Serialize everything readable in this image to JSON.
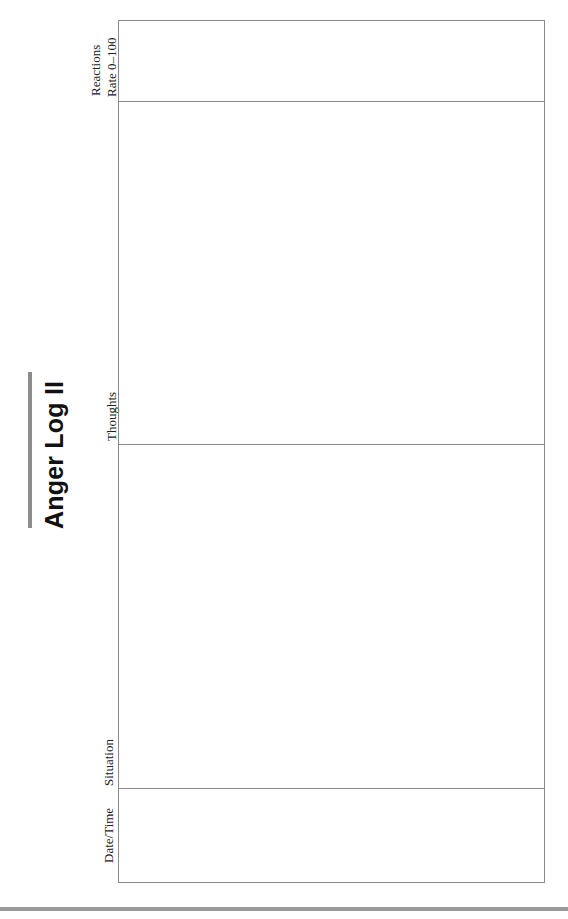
{
  "page": {
    "title": "Anger Log II"
  },
  "table": {
    "columns": [
      {
        "label": "Date/Time"
      },
      {
        "label": "Situation"
      },
      {
        "label": "Thoughts"
      },
      {
        "label_line1": "Reactions",
        "label_line2": "Rate 0–100"
      }
    ],
    "rows": []
  },
  "colors": {
    "title_bar": "#8c8c8c",
    "grid_line": "#8a8a8a",
    "bottom_band": "#9a9a9a"
  }
}
